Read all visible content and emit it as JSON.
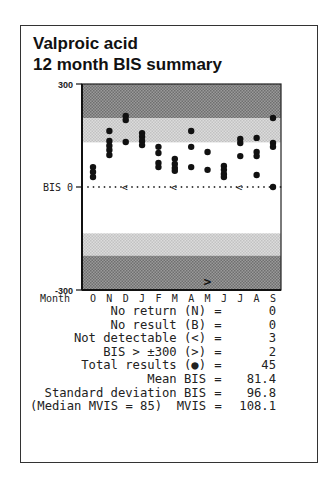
{
  "title": {
    "line1": "Valproic acid",
    "line2": "12 month BIS summary"
  },
  "chart_data": {
    "type": "scatter",
    "title": "Valproic acid 12 month BIS summary",
    "xlabel": "Month",
    "ylabel": "BIS",
    "ylim": [
      -300,
      300
    ],
    "y_ticks": [
      {
        "value": 300,
        "label": "300"
      },
      {
        "value": 0,
        "label": "BIS 0"
      },
      {
        "value": -300,
        "label": "-300"
      }
    ],
    "categories": [
      "O",
      "N",
      "D",
      "J",
      "F",
      "M",
      "A",
      "M",
      "J",
      "J",
      "A",
      "S"
    ],
    "bands": [
      {
        "from": 200,
        "to": 300,
        "shade": "dark"
      },
      {
        "from": 130,
        "to": 200,
        "shade": "light"
      },
      {
        "from": -200,
        "to": -135,
        "shade": "light"
      },
      {
        "from": -300,
        "to": -200,
        "shade": "dark"
      }
    ],
    "points": [
      [
        58,
        44,
        29
      ],
      [
        163,
        134,
        120,
        108,
        93
      ],
      [
        207,
        195,
        131
      ],
      [
        157,
        146,
        134,
        122
      ],
      [
        117,
        99,
        70,
        58
      ],
      [
        82,
        67,
        55,
        47
      ],
      [
        163,
        117,
        58
      ],
      [
        102,
        50
      ],
      [
        61,
        50,
        38,
        29
      ],
      [
        140,
        128,
        90
      ],
      [
        143,
        102,
        90,
        35
      ],
      [
        201,
        128,
        117,
        0
      ]
    ],
    "not_detectable_months": [
      2,
      5,
      9
    ],
    "out_of_range_markers": [
      {
        "month_index": 7,
        "direction": "below",
        "symbol": ">"
      }
    ],
    "zero_line": "dotted"
  },
  "stats": [
    {
      "label": "No return (N)",
      "value": "0"
    },
    {
      "label": "No result (B)",
      "value": "0"
    },
    {
      "label": "Not detectable (<)",
      "value": "3"
    },
    {
      "label": "BIS > ±300 (>)",
      "value": "2"
    },
    {
      "label": "Total results (●)",
      "value": "45"
    },
    {
      "label": "Mean BIS",
      "value": "81.4"
    },
    {
      "label": "Standard deviation BIS",
      "value": "96.8"
    },
    {
      "label": "(Median MVIS = 85)  MVIS",
      "value": "108.1"
    }
  ],
  "eq_sign": "="
}
